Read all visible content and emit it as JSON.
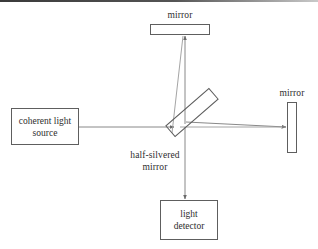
{
  "figure": {
    "type": "optics-diagram",
    "background_color": "#ffffff",
    "line_color": "#5e5e5e",
    "text_color": "#2e2e2e"
  },
  "components": {
    "source": {
      "label_line1": "coherent light",
      "label_line2": "source",
      "shape": "rectangle"
    },
    "detector": {
      "label_line1": "light",
      "label_line2": "detector",
      "shape": "rectangle"
    },
    "mirror_top": {
      "label": "mirror",
      "shape": "horizontal-bar"
    },
    "mirror_right": {
      "label": "mirror",
      "shape": "vertical-bar"
    },
    "beam_splitter": {
      "label_line1": "half-silvered",
      "label_line2": "mirror",
      "shape": "tilted-rectangle",
      "angle_degrees": -41
    }
  },
  "beams": [
    {
      "name": "source-to-splitter",
      "from": "coherent light source",
      "to": "half-silvered mirror",
      "direction": "right",
      "arrow": true
    },
    {
      "name": "splitter-to-top-mirror",
      "from": "half-silvered mirror",
      "to": "mirror",
      "direction": "up",
      "arrow": true
    },
    {
      "name": "top-mirror-return",
      "from": "mirror",
      "to": "half-silvered mirror",
      "direction": "down",
      "arrow": true
    },
    {
      "name": "splitter-to-right-mirror",
      "from": "half-silvered mirror",
      "to": "mirror",
      "direction": "right",
      "arrow": true
    },
    {
      "name": "right-mirror-return",
      "from": "mirror",
      "to": "half-silvered mirror",
      "direction": "left",
      "arrow": true
    },
    {
      "name": "splitter-to-detector",
      "from": "half-silvered mirror",
      "to": "light detector",
      "direction": "down",
      "arrow": true
    }
  ]
}
